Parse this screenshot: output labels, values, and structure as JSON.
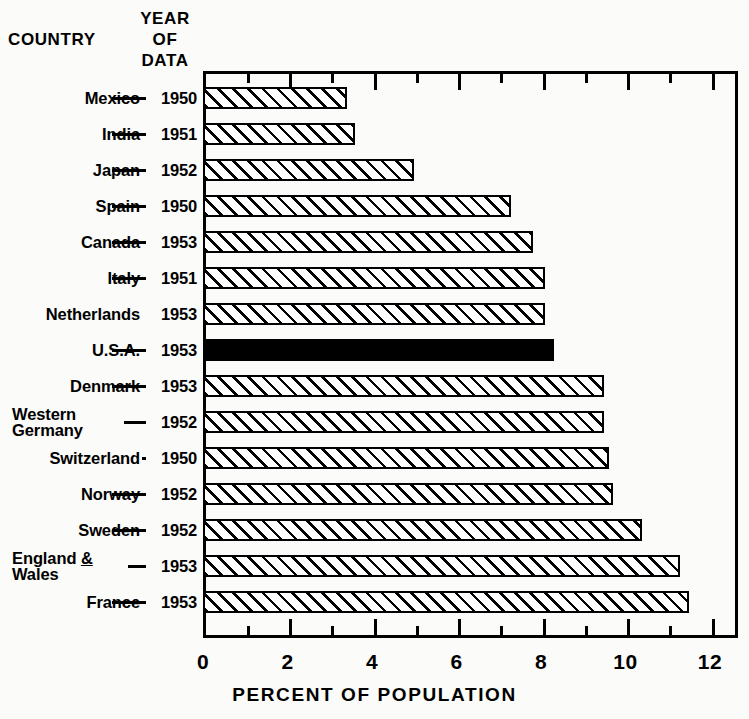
{
  "header": {
    "country_label": "COUNTRY",
    "year_label_lines": [
      "YEAR",
      "OF",
      "DATA"
    ]
  },
  "axis": {
    "title": "PERCENT OF POPULATION",
    "tick_labels": [
      "0",
      "2",
      "4",
      "6",
      "8",
      "10",
      "12"
    ]
  },
  "rows": [
    {
      "country": "Mexico",
      "year": "1950",
      "value": 3.4,
      "highlight": false
    },
    {
      "country": "India",
      "year": "1951",
      "value": 3.6,
      "highlight": false
    },
    {
      "country": "Japan",
      "year": "1952",
      "value": 5.0,
      "highlight": false
    },
    {
      "country": "Spain",
      "year": "1950",
      "value": 7.3,
      "highlight": false
    },
    {
      "country": "Canada",
      "year": "1953",
      "value": 7.8,
      "highlight": false
    },
    {
      "country": "Italy",
      "year": "1951",
      "value": 8.1,
      "highlight": false
    },
    {
      "country": "Netherlands",
      "year": "1953",
      "value": 8.1,
      "highlight": false
    },
    {
      "country": "U.S.A.",
      "year": "1953",
      "value": 8.3,
      "highlight": true
    },
    {
      "country": "Denmark",
      "year": "1953",
      "value": 9.5,
      "highlight": false
    },
    {
      "country": "Western Germany",
      "year": "1952",
      "value": 9.5,
      "highlight": false
    },
    {
      "country": "Switzerland",
      "year": "1950",
      "value": 9.6,
      "highlight": false
    },
    {
      "country": "Norway",
      "year": "1952",
      "value": 9.7,
      "highlight": false
    },
    {
      "country": "Sweden",
      "year": "1952",
      "value": 10.4,
      "highlight": false
    },
    {
      "country": "England & Wales",
      "year": "1953",
      "value": 11.3,
      "highlight": false
    },
    {
      "country": "France",
      "year": "1953",
      "value": 11.5,
      "highlight": false
    }
  ],
  "colors": {
    "ink": "#000000",
    "paper": "#fbfbf9",
    "highlight_fill": "#000000"
  },
  "chart_data": {
    "type": "bar",
    "orientation": "horizontal",
    "title": "",
    "xlabel": "PERCENT OF POPULATION",
    "ylabel": "COUNTRY",
    "xlim": [
      0,
      12
    ],
    "xticks": [
      0,
      2,
      4,
      6,
      8,
      10,
      12
    ],
    "minor_xticks": [
      1,
      3,
      5,
      7,
      9,
      11
    ],
    "grid": false,
    "legend": false,
    "categories": [
      "Mexico",
      "India",
      "Japan",
      "Spain",
      "Canada",
      "Italy",
      "Netherlands",
      "U.S.A.",
      "Denmark",
      "Western Germany",
      "Switzerland",
      "Norway",
      "Sweden",
      "England & Wales",
      "France"
    ],
    "category_years": [
      "1950",
      "1951",
      "1952",
      "1950",
      "1953",
      "1951",
      "1953",
      "1953",
      "1953",
      "1952",
      "1950",
      "1952",
      "1952",
      "1953",
      "1953"
    ],
    "values": [
      3.4,
      3.6,
      5.0,
      7.3,
      7.8,
      8.1,
      8.1,
      8.3,
      9.5,
      9.5,
      9.6,
      9.7,
      10.4,
      11.3,
      11.5
    ],
    "highlighted_category": "U.S.A.",
    "annotations": []
  }
}
